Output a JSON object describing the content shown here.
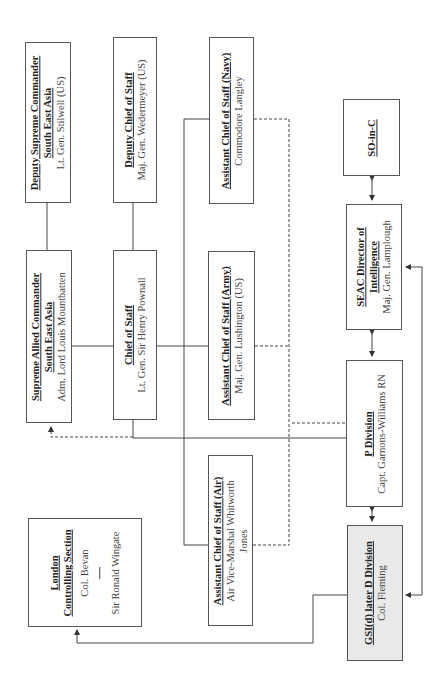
{
  "diagram": {
    "type": "org-chart",
    "orientation": "rotated-90-ccw",
    "colors": {
      "line": "#444444",
      "box_border": "#555555",
      "shaded_fill": "#e8e9e8",
      "background": "#ffffff"
    },
    "nodes": {
      "deputy_supreme": {
        "title_lines": [
          "Deputy Supreme Commander",
          "South East Asia"
        ],
        "person": "Lt. Gen. Stilwell (US)"
      },
      "deputy_cos": {
        "title_lines": [
          "Deputy Chief of Staff"
        ],
        "person": "Maj. Gen. Wedermeyer (US)"
      },
      "acos_navy": {
        "title_lines": [
          "Assistant Chief of Staff (Navy)"
        ],
        "person": "Commodore Langley"
      },
      "so_in_c": {
        "title_lines": [
          "SO-in-C"
        ],
        "person": ""
      },
      "supreme": {
        "title_lines": [
          "Supreme Allied Commander",
          "South East Asia"
        ],
        "person": "Adm. Lord Louis Mountbatten"
      },
      "cos": {
        "title_lines": [
          "Chief of Staff"
        ],
        "person": "Lt. Gen. Sir Henry Pownall"
      },
      "acos_army": {
        "title_lines": [
          "Assistant Chief of Staff (Army)"
        ],
        "person": "Maj. Gen. Lushington (US)"
      },
      "seac_doi": {
        "title_lines": [
          "SEAC Director of",
          "Intelligence"
        ],
        "person": "Maj. Gen. Lamplough"
      },
      "p_division": {
        "title_lines": [
          "P Division"
        ],
        "person": "Capt. Garnons-Williams RN"
      },
      "acos_air": {
        "title_lines": [
          "Assistant Chief of Staff (Air)"
        ],
        "person_lines": [
          "Air Vice-Marshal Whitworth",
          "Jones"
        ]
      },
      "london": {
        "title_lines": [
          "London",
          "Controlling Section"
        ],
        "person": "Col. Bevan",
        "person2": "Sir Ronald Wingate"
      },
      "gsi": {
        "title_lines": [
          "GSI(d) later D Division"
        ],
        "person": "Col. Fleming",
        "shaded": true
      }
    },
    "edges": [
      {
        "from": "deputy_supreme",
        "to": "supreme",
        "style": "solid"
      },
      {
        "from": "deputy_cos",
        "to": "cos",
        "style": "solid"
      },
      {
        "from": "supreme",
        "to": "cos",
        "style": "solid"
      },
      {
        "from": "cos",
        "to": "acos_army",
        "style": "solid"
      },
      {
        "from": "cos",
        "to": "acos_navy",
        "style": "solid"
      },
      {
        "from": "cos",
        "to": "acos_air",
        "style": "solid"
      },
      {
        "from": "cos",
        "to": "p_division",
        "style": "solid"
      },
      {
        "from": "acos_navy",
        "to": "p_division",
        "style": "dashed"
      },
      {
        "from": "acos_army",
        "to": "p_division",
        "style": "dashed"
      },
      {
        "from": "acos_air",
        "to": "p_division",
        "style": "dashed"
      },
      {
        "from": "p_division",
        "to": "supreme",
        "style": "dashed-arrow"
      },
      {
        "from": "so_in_c",
        "to": "seac_doi",
        "style": "double-arrow"
      },
      {
        "from": "seac_doi",
        "to": "p_division",
        "style": "double-arrow"
      },
      {
        "from": "p_division",
        "to": "gsi",
        "style": "double-arrow"
      },
      {
        "from": "gsi",
        "to": "london",
        "style": "arrow"
      },
      {
        "from": "gsi",
        "to": "seac_doi",
        "style": "arrow-both-ends-via-right"
      }
    ]
  }
}
